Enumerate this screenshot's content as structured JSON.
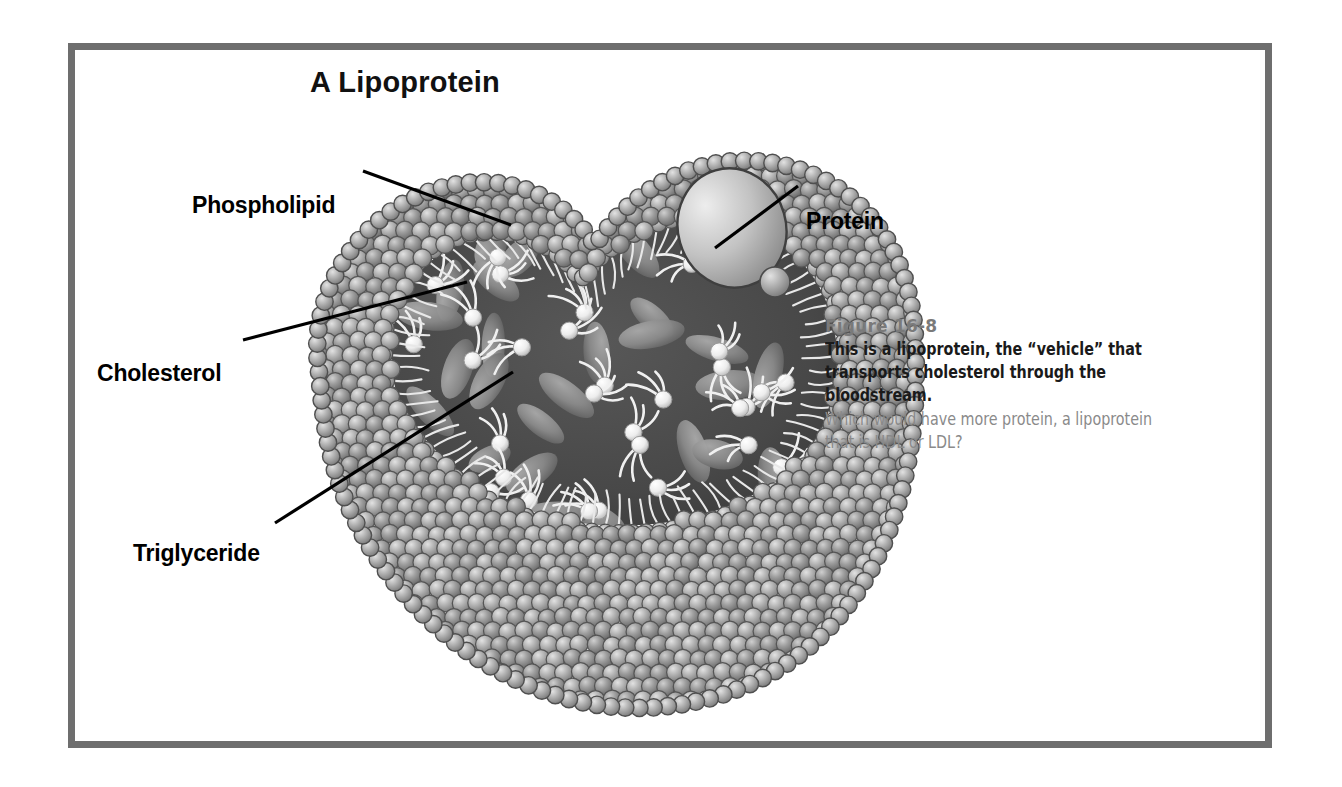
{
  "figure": {
    "title": "A Lipoprotein",
    "frame_color": "#6e6e6e",
    "background_color": "#ffffff"
  },
  "callouts": [
    {
      "id": "phospholipid",
      "label": "Phospholipid"
    },
    {
      "id": "protein",
      "label": "Protein"
    },
    {
      "id": "cholesterol",
      "label": "Cholesterol"
    },
    {
      "id": "triglyceride",
      "label": "Triglyceride"
    }
  ],
  "caption": {
    "figure_number": "Figure 16-8",
    "body": "This is a lipoprotein, the “vehicle” that transports cholesterol through the bloodstream.",
    "question": "Which would have more protein, a lipoprotein that is HDL or LDL?",
    "body_color": "#1a1a1a",
    "question_color": "#8a8a8a",
    "number_color": "#7a7a7a"
  },
  "illustration": {
    "description": "Cutaway lipoprotein sphere with phospholipid bead surface, dark hydrophobic core, triglycerides, cholesterol and an embedded protein",
    "surface_bead_color": "#a8a8a8",
    "core_color": "#4a4a4a",
    "protein_color": "#c8c8c8",
    "triglyceride_head_color": "#f2f2f2",
    "cholesterol_color": "#8d8d8d",
    "leader_line_color": "#000000"
  }
}
